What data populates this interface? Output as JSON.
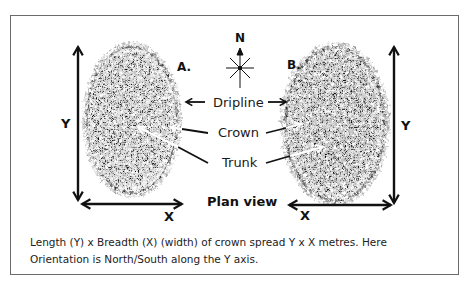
{
  "diagram": {
    "title": "Plan view",
    "compass": {
      "north_label": "N"
    },
    "trees": [
      {
        "id": "A",
        "label": "A.",
        "y_axis_label": "Y",
        "x_axis_label": "X"
      },
      {
        "id": "B",
        "label": "B.",
        "y_axis_label": "Y",
        "x_axis_label": "X"
      }
    ],
    "parts": [
      {
        "label": "Dripline"
      },
      {
        "label": "Crown"
      },
      {
        "label": "Trunk"
      }
    ],
    "caption": {
      "line1": "Length (Y) x Breadth (X) (width) of crown spread Y x X metres. Here",
      "line2": "Orientation is North/South along the Y axis."
    },
    "colors": {
      "frame": "#6b6b6b",
      "ink": "#111111",
      "canopy_dark": "#0d0d0d",
      "canopy_mid": "#4a4a4a",
      "canopy_light": "#9a9a9a"
    }
  }
}
